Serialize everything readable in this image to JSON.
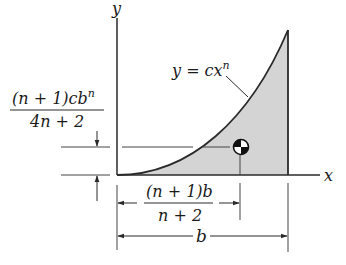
{
  "diagram": {
    "axes": {
      "x_label": "x",
      "y_label": "y"
    },
    "curve": {
      "equation_lhs": "y = cx",
      "equation_exp": "n"
    },
    "region_fill": "#d4d4d4",
    "line_color": "#2a2a2a",
    "centroid_symbol": "centroid-icon",
    "dimensions": {
      "y_bar": {
        "numerator_prefix": "(n + 1)cb",
        "numerator_exp": "n",
        "denominator": "4n + 2"
      },
      "x_bar": {
        "numerator": "(n + 1)b",
        "denominator": "n + 2"
      },
      "width": {
        "label": "b"
      }
    }
  }
}
